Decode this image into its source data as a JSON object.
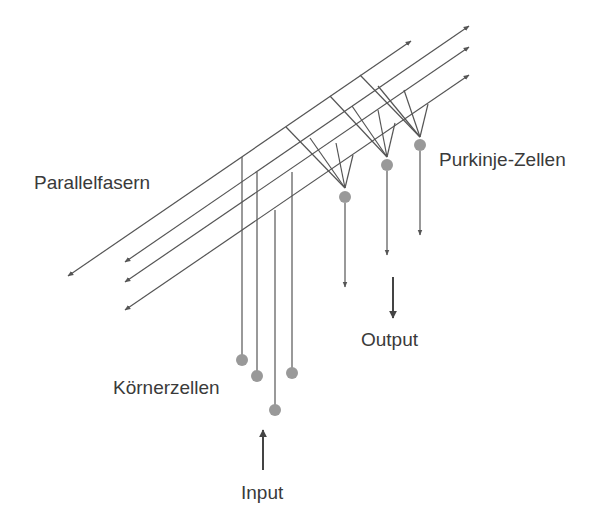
{
  "diagram": {
    "type": "cerebellar-circuit",
    "colors": {
      "line": "#555555",
      "cell": "#999999",
      "text": "#3a3a3a",
      "background": "#ffffff"
    },
    "labels": {
      "parallel_fibers": "Parallelfasern",
      "purkinje_cells": "Purkinje-Zellen",
      "granule_cells": "Körnerzellen",
      "input": "Input",
      "output": "Output"
    },
    "parallel_fibers": [
      {
        "id": "pf1",
        "from": [
          68,
          276
        ],
        "to": [
          411,
          41
        ]
      },
      {
        "id": "pf2",
        "from": [
          125,
          262
        ],
        "to": [
          469,
          26
        ]
      },
      {
        "id": "pf3",
        "from": [
          125,
          282
        ],
        "to": [
          469,
          47
        ]
      },
      {
        "id": "pf4",
        "from": [
          125,
          310
        ],
        "to": [
          469,
          75
        ]
      }
    ],
    "granule_cells": [
      {
        "id": "gc1",
        "cx": 242,
        "cy": 360,
        "axon_top": 157
      },
      {
        "id": "gc2",
        "cx": 257,
        "cy": 376,
        "axon_top": 172
      },
      {
        "id": "gc3",
        "cx": 275,
        "cy": 410,
        "axon_top": 210
      },
      {
        "id": "gc4",
        "cx": 292,
        "cy": 373,
        "axon_top": 172
      }
    ],
    "purkinje_cells": [
      {
        "id": "pc1",
        "cx": 345,
        "cy": 197,
        "apex": [
          345,
          188
        ],
        "axon_end": 287,
        "dendrites": [
          [
            286,
            127
          ],
          [
            310,
            138
          ],
          [
            336,
            143
          ],
          [
            353,
            155
          ]
        ]
      },
      {
        "id": "pc2",
        "cx": 387,
        "cy": 165,
        "apex": [
          387,
          157
        ],
        "axon_end": 255,
        "dendrites": [
          [
            330,
            96
          ],
          [
            352,
            106
          ],
          [
            378,
            110
          ],
          [
            395,
            123
          ]
        ]
      },
      {
        "id": "pc3",
        "cx": 420,
        "cy": 145,
        "apex": [
          420,
          137
        ],
        "axon_end": 235,
        "dendrites": [
          [
            360,
            75
          ],
          [
            378,
            86
          ],
          [
            404,
            90
          ],
          [
            428,
            104
          ]
        ]
      }
    ],
    "input_arrow": {
      "x": 263,
      "from_y": 470,
      "to_y": 430
    },
    "output_arrow": {
      "x": 393,
      "from_y": 277,
      "to_y": 318
    }
  }
}
